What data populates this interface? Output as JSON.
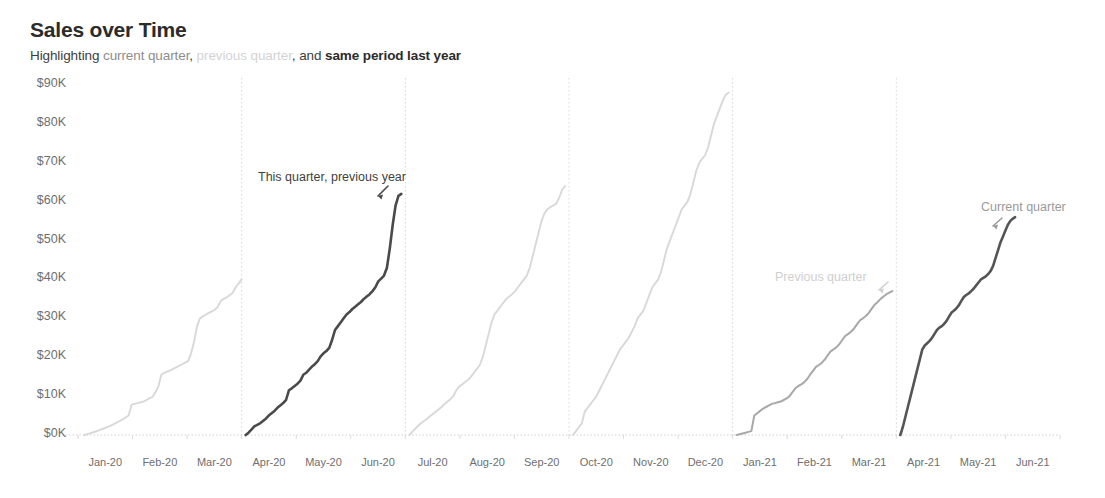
{
  "header": {
    "title": "Sales over Time",
    "subtitle_segments": [
      {
        "text": "Highlighting ",
        "style": "normal"
      },
      {
        "text": "current quarter",
        "style": "current"
      },
      {
        "text": ", ",
        "style": "normal"
      },
      {
        "text": "previous quarter",
        "style": "previous"
      },
      {
        "text": ", and ",
        "style": "normal"
      },
      {
        "text": "same period last year",
        "style": "strong"
      }
    ]
  },
  "annotations": [
    {
      "name": "annotation-this-quarter-previous-year",
      "text": "This quarter, previous year",
      "x": 258,
      "y": 170,
      "tone": "dark"
    },
    {
      "name": "annotation-previous-quarter",
      "text": "Previous quarter",
      "x": 775,
      "y": 270,
      "tone": "light"
    },
    {
      "name": "annotation-current-quarter",
      "text": "Current quarter",
      "x": 981,
      "y": 200,
      "tone": "mid"
    }
  ],
  "colors": {
    "highlight_dark": "#4a4a4a",
    "current_quarter": "#555555",
    "previous_quarter": "#a8a8a8",
    "muted": "#d8d8d8",
    "axis_text": "#6e6e6e",
    "gridline": "#d0d0d0",
    "title": "#2b2b2b",
    "background": "#ffffff"
  },
  "chart_data": {
    "type": "line",
    "title": "Sales over Time",
    "subtitle": "Highlighting current quarter, previous quarter, and same period last year",
    "xlabel": "",
    "ylabel": "",
    "grid": false,
    "legend": "annotations-inline",
    "y_ticks": [
      "$0K",
      "$10K",
      "$20K",
      "$30K",
      "$40K",
      "$50K",
      "$60K",
      "$70K",
      "$80K",
      "$90K"
    ],
    "y_tick_values": [
      0,
      10000,
      20000,
      30000,
      40000,
      50000,
      60000,
      70000,
      80000,
      90000
    ],
    "ylim": [
      0,
      90000
    ],
    "x_ticks": [
      "Jan-20",
      "Feb-20",
      "Mar-20",
      "Apr-20",
      "May-20",
      "Jun-20",
      "Jul-20",
      "Aug-20",
      "Sep-20",
      "Oct-20",
      "Nov-20",
      "Dec-20",
      "Jan-21",
      "Feb-21",
      "Mar-21",
      "Apr-21",
      "May-21",
      "Jun-21"
    ],
    "quarter_dividers": [
      "Apr-20",
      "Jul-20",
      "Oct-20",
      "Jan-21",
      "Apr-21"
    ],
    "note": "Each quarter is a running cumulative sales total that resets to $0K at the start of the quarter.",
    "series": [
      {
        "name": "Q1 2020",
        "emphasis": "muted",
        "color": "#d8d8d8",
        "peak_value": 40000,
        "x_start": "Jan-20",
        "x_end": "Mar-20",
        "values": [
          0,
          200,
          400,
          700,
          900,
          1200,
          1500,
          1800,
          2100,
          2400,
          2800,
          3200,
          3600,
          4000,
          4500,
          5000,
          7800,
          8000,
          8200,
          8400,
          8600,
          9000,
          9400,
          9800,
          11000,
          12500,
          15500,
          16000,
          16300,
          16600,
          17000,
          17400,
          17800,
          18200,
          18600,
          19000,
          21000,
          24000,
          28000,
          30000,
          30500,
          31000,
          31400,
          31800,
          32200,
          33000,
          34500,
          35000,
          35400,
          36000,
          36600,
          38000,
          39000,
          40000
        ]
      },
      {
        "name": "Q2 2020",
        "label": "This quarter, previous year",
        "emphasis": "highlight",
        "color": "#4a4a4a",
        "peak_value": 62000,
        "x_start": "Apr-20",
        "x_end": "Jun-20",
        "values": [
          0,
          600,
          1400,
          2200,
          2600,
          3000,
          3600,
          4200,
          5000,
          5600,
          6200,
          7000,
          7600,
          8200,
          9000,
          11500,
          12000,
          12600,
          13200,
          14000,
          15500,
          16000,
          16800,
          17600,
          18200,
          19000,
          20200,
          21000,
          21600,
          22400,
          24500,
          27000,
          28000,
          29000,
          30000,
          31000,
          31600,
          32400,
          33000,
          33600,
          34200,
          35000,
          35600,
          36200,
          37000,
          38000,
          39500,
          40200,
          41000,
          43000,
          48000,
          54000,
          59000,
          61500,
          62000
        ]
      },
      {
        "name": "Q3 2020",
        "emphasis": "muted",
        "color": "#d8d8d8",
        "peak_value": 64000,
        "x_start": "Jul-20",
        "x_end": "Sep-20",
        "values": [
          0,
          800,
          1600,
          2400,
          3000,
          3600,
          4200,
          4800,
          5400,
          6000,
          6600,
          7200,
          8000,
          8600,
          9200,
          10000,
          11500,
          12500,
          13000,
          13600,
          14200,
          15000,
          16000,
          17000,
          18000,
          20000,
          23000,
          26000,
          29000,
          31000,
          32000,
          33000,
          34000,
          35000,
          35600,
          36200,
          37000,
          38000,
          39000,
          40000,
          41000,
          43000,
          46000,
          49000,
          52000,
          55000,
          57000,
          58000,
          58600,
          59000,
          59500,
          61000,
          63000,
          64000
        ]
      },
      {
        "name": "Q4 2020",
        "emphasis": "muted",
        "color": "#d8d8d8",
        "peak_value": 88000,
        "x_start": "Oct-20",
        "x_end": "Dec-20",
        "values": [
          0,
          1000,
          2000,
          3000,
          6000,
          7000,
          8000,
          9000,
          10000,
          11500,
          13000,
          14500,
          16000,
          17500,
          19000,
          20500,
          22000,
          23000,
          24000,
          25000,
          26500,
          28000,
          30000,
          31000,
          32000,
          34000,
          36000,
          38000,
          39000,
          40000,
          42000,
          45000,
          48000,
          50000,
          52000,
          54000,
          56000,
          58000,
          59000,
          60000,
          62000,
          65000,
          68000,
          70000,
          71000,
          72000,
          74000,
          77000,
          80000,
          82000,
          84000,
          86000,
          87500,
          88000
        ]
      },
      {
        "name": "Q1 2021",
        "label": "Previous quarter",
        "emphasis": "previous",
        "color": "#a8a8a8",
        "peak_value": 37000,
        "x_start": "Jan-21",
        "x_end": "Mar-21",
        "values": [
          0,
          200,
          400,
          600,
          800,
          1000,
          5000,
          5600,
          6200,
          6800,
          7200,
          7600,
          8000,
          8200,
          8400,
          8600,
          9000,
          9400,
          10000,
          11000,
          12000,
          12600,
          13000,
          13600,
          14400,
          15500,
          16500,
          17500,
          18000,
          18600,
          19400,
          20500,
          21500,
          22000,
          22600,
          23400,
          24500,
          25500,
          26000,
          26600,
          27400,
          28500,
          29500,
          30000,
          30600,
          31400,
          32500,
          33500,
          34200,
          35000,
          35600,
          36200,
          36600,
          37000
        ]
      },
      {
        "name": "Q2 2021",
        "label": "Current quarter",
        "emphasis": "highlight",
        "color": "#555555",
        "peak_value": 56000,
        "x_start": "Apr-21",
        "x_end": "May-21",
        "partial": true,
        "values": [
          0,
          2000,
          4500,
          7000,
          9500,
          12000,
          14500,
          17000,
          19500,
          22000,
          23000,
          23600,
          24200,
          25000,
          26000,
          27000,
          27600,
          28000,
          28600,
          29400,
          30500,
          31500,
          32000,
          32600,
          33400,
          34500,
          35500,
          36000,
          36400,
          37000,
          37600,
          38400,
          39200,
          40000,
          40400,
          40800,
          41400,
          42200,
          43500,
          45500,
          47500,
          49500,
          51000,
          52500,
          54000,
          55000,
          55600,
          56000
        ]
      }
    ]
  }
}
